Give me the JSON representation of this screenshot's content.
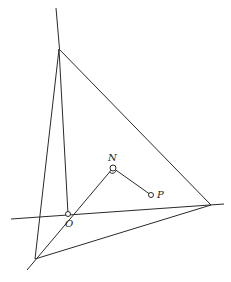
{
  "diagram": {
    "labels": {
      "N": "N",
      "P": "P",
      "O": "O"
    },
    "points": {
      "A": [
        59,
        49
      ],
      "B": [
        211,
        205
      ],
      "C": [
        35,
        259
      ],
      "O": [
        68,
        214
      ],
      "N": [
        113,
        168
      ],
      "P": [
        151,
        195
      ]
    },
    "segments": [
      {
        "name": "vertical-line",
        "from": [
          56,
          8
        ],
        "to": [
          59,
          49
        ]
      },
      {
        "name": "A-O",
        "from": [
          59,
          49
        ],
        "to": [
          68,
          214
        ]
      },
      {
        "name": "A-C",
        "from": [
          59,
          49
        ],
        "to": [
          35,
          259
        ]
      },
      {
        "name": "A-B",
        "from": [
          59,
          49
        ],
        "to": [
          211,
          205
        ]
      },
      {
        "name": "B-C",
        "from": [
          211,
          205
        ],
        "to": [
          35,
          259
        ]
      },
      {
        "name": "horizontal-line",
        "from": [
          11,
          219
        ],
        "to": [
          224,
          204
        ]
      },
      {
        "name": "C-N-line",
        "from": [
          27,
          270
        ],
        "to": [
          113,
          168
        ]
      },
      {
        "name": "N-P",
        "from": [
          113,
          168
        ],
        "to": [
          151,
          195
        ]
      }
    ],
    "colors": {
      "stroke": "#2a2a2a",
      "background": "#ffffff"
    }
  }
}
